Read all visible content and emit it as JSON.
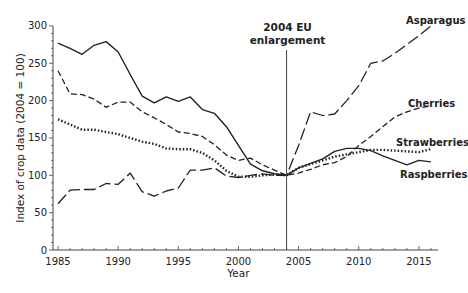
{
  "chart_data": {
    "type": "line",
    "title": "",
    "xlabel": "Year",
    "ylabel": "Index of crop data (2004 = 100)",
    "xlim": [
      1984.5,
      2016.5
    ],
    "ylim": [
      0,
      300
    ],
    "x_ticks": [
      1985,
      1990,
      1995,
      2000,
      2005,
      2010,
      2015
    ],
    "y_ticks": [
      0,
      50,
      100,
      150,
      200,
      250,
      300
    ],
    "grid": false,
    "legend_position": "inline-right",
    "annotations": [
      {
        "text": "2004 EU enlargement",
        "x": 2004,
        "type": "vertical-line"
      }
    ],
    "x": [
      1985,
      1986,
      1987,
      1988,
      1989,
      1990,
      1991,
      1992,
      1993,
      1994,
      1995,
      1996,
      1997,
      1998,
      1999,
      2000,
      2001,
      2002,
      2003,
      2004,
      2005,
      2006,
      2007,
      2008,
      2009,
      2010,
      2011,
      2012,
      2013,
      2014,
      2015,
      2016
    ],
    "series": [
      {
        "name": "Raspberries",
        "style": "solid",
        "values": [
          277,
          270,
          262,
          274,
          279,
          265,
          235,
          206,
          197,
          205,
          199,
          205,
          188,
          183,
          165,
          140,
          115,
          106,
          102,
          100,
          110,
          116,
          122,
          132,
          136,
          136,
          133,
          126,
          120,
          114,
          120,
          118
        ]
      },
      {
        "name": "Cherries",
        "style": "dashed",
        "values": [
          240,
          209,
          208,
          202,
          191,
          198,
          198,
          185,
          177,
          168,
          158,
          156,
          152,
          141,
          127,
          120,
          123,
          114,
          107,
          100,
          103,
          108,
          114,
          117,
          125,
          140,
          152,
          165,
          178,
          185,
          190,
          193
        ]
      },
      {
        "name": "Strawberries",
        "style": "dotted",
        "values": [
          175,
          168,
          161,
          161,
          158,
          155,
          150,
          145,
          142,
          136,
          135,
          135,
          130,
          120,
          106,
          98,
          98,
          100,
          101,
          100,
          110,
          115,
          120,
          125,
          128,
          131,
          134,
          134,
          133,
          132,
          131,
          135
        ]
      },
      {
        "name": "Asparagus",
        "style": "long-dash",
        "values": [
          62,
          80,
          81,
          81,
          89,
          88,
          103,
          78,
          72,
          79,
          83,
          107,
          107,
          110,
          99,
          97,
          100,
          102,
          100,
          100,
          140,
          185,
          180,
          182,
          200,
          220,
          250,
          253,
          263,
          275,
          287,
          300
        ]
      }
    ]
  },
  "labels": {
    "annotation": [
      "2004 EU",
      "enlargement"
    ],
    "series": [
      "Asparagus",
      "Cherries",
      "Strawberries",
      "Raspberries"
    ],
    "xlabel": "Year",
    "ylabel": "Index of crop data (2004 = 100)"
  }
}
